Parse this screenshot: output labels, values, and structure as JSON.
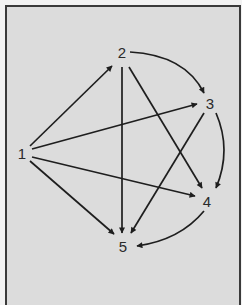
{
  "diagram": {
    "type": "directed-graph",
    "colors": {
      "background": "#dcdcdc",
      "edge": "#1e1e1e",
      "frame": "#3a3a3a",
      "label": "#2a2a2a"
    },
    "nodes": [
      {
        "id": "1",
        "label": "1",
        "x": 22,
        "y": 153
      },
      {
        "id": "2",
        "label": "2",
        "x": 122,
        "y": 52
      },
      {
        "id": "3",
        "label": "3",
        "x": 210,
        "y": 103
      },
      {
        "id": "4",
        "label": "4",
        "x": 207,
        "y": 201
      },
      {
        "id": "5",
        "label": "5",
        "x": 123,
        "y": 246
      }
    ],
    "edges": [
      {
        "from": "1",
        "to": "2",
        "shape": "straight"
      },
      {
        "from": "1",
        "to": "3",
        "shape": "straight"
      },
      {
        "from": "1",
        "to": "4",
        "shape": "straight"
      },
      {
        "from": "1",
        "to": "5",
        "shape": "straight"
      },
      {
        "from": "2",
        "to": "3",
        "shape": "curved"
      },
      {
        "from": "2",
        "to": "4",
        "shape": "straight"
      },
      {
        "from": "2",
        "to": "5",
        "shape": "straight"
      },
      {
        "from": "3",
        "to": "4",
        "shape": "curved"
      },
      {
        "from": "3",
        "to": "5",
        "shape": "straight"
      },
      {
        "from": "4",
        "to": "5",
        "shape": "curved"
      }
    ]
  }
}
